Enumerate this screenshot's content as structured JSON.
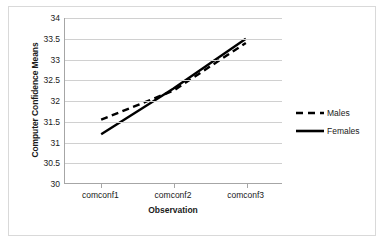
{
  "chart_data": {
    "type": "line",
    "title": "",
    "xlabel": "Observation",
    "ylabel": "Computer Confidence Means",
    "categories": [
      "comconf1",
      "comconf2",
      "comconf3"
    ],
    "ylim": [
      30,
      34
    ],
    "yticks": [
      30,
      30.5,
      31,
      31.5,
      32,
      32.5,
      33,
      33.5,
      34
    ],
    "ytick_labels": [
      "30",
      "30.5",
      "31",
      "31.5",
      "32",
      "32.5",
      "33",
      "33.5",
      "34"
    ],
    "grid": true,
    "legend_position": "right",
    "series": [
      {
        "name": "Males",
        "style": "dashed",
        "color": "#000000",
        "values": [
          31.55,
          32.25,
          33.4
        ]
      },
      {
        "name": "Females",
        "style": "solid",
        "color": "#000000",
        "values": [
          31.2,
          32.3,
          33.5
        ]
      }
    ]
  },
  "legend": {
    "items": [
      {
        "label": "Males",
        "style": "dashed"
      },
      {
        "label": "Females",
        "style": "solid"
      }
    ]
  },
  "colors": {
    "line": "#000000",
    "grid": "#d0d0d0",
    "axis": "#a6a6a6",
    "frame": "#d9d9d9",
    "text": "#202020"
  }
}
